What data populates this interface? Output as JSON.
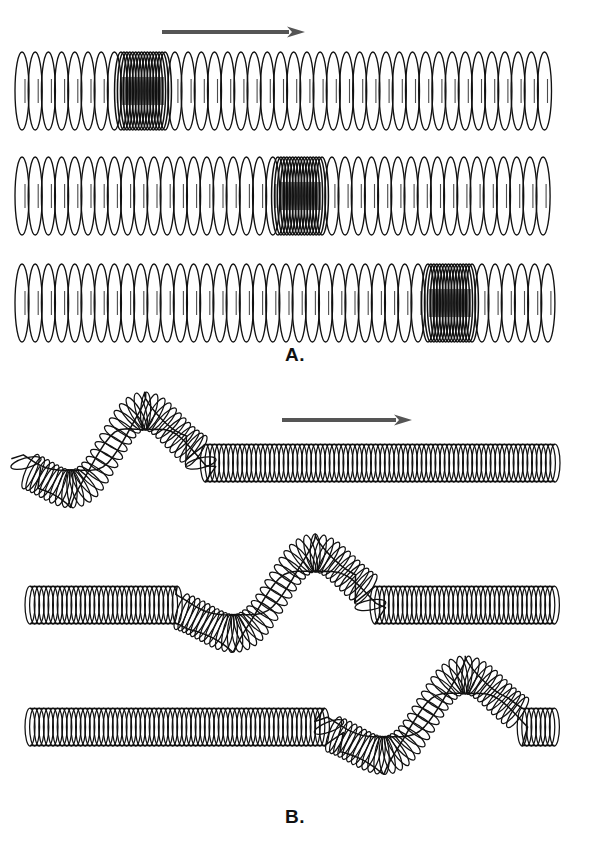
{
  "figure": {
    "background_color": "#ffffff",
    "ink_color": "#111111",
    "arrow_color": "#555555",
    "width": 592,
    "height": 853
  },
  "panels": [
    {
      "id": "panel-a",
      "label": "A.",
      "label_x": 295,
      "label_y": 356,
      "wave_type": "longitudinal",
      "description": "Compression pulse moving left to right along a stretched spring",
      "direction_arrow": {
        "name": "propagation-arrow-a",
        "x1": 162,
        "y1": 32,
        "x2": 305,
        "y2": 32,
        "color": "#555555",
        "thickness": 4,
        "head_length": 16,
        "head_width": 11
      },
      "springs": [
        {
          "name": "spring-row-1",
          "frame": 1,
          "y_center": 91,
          "x_start": 22,
          "x_end": 556,
          "coil_half_height": 39,
          "coil_half_width": 7.0,
          "normal_spacing": 13.2,
          "compression_center": 143,
          "compression_half_width": 22,
          "compression_spacing": 3.1,
          "compression_coils": 15
        },
        {
          "name": "spring-row-2",
          "frame": 2,
          "y_center": 196,
          "x_start": 22,
          "x_end": 556,
          "coil_half_height": 39,
          "coil_half_width": 7.0,
          "normal_spacing": 13.2,
          "compression_center": 300,
          "compression_half_width": 22,
          "compression_spacing": 3.1,
          "compression_coils": 15
        },
        {
          "name": "spring-row-3",
          "frame": 3,
          "y_center": 303,
          "x_start": 22,
          "x_end": 556,
          "coil_half_height": 39,
          "coil_half_width": 7.0,
          "normal_spacing": 13.2,
          "compression_center": 450,
          "compression_half_width": 22,
          "compression_spacing": 3.1,
          "compression_coils": 15
        }
      ]
    },
    {
      "id": "panel-b",
      "label": "B.",
      "label_x": 295,
      "label_y": 820,
      "wave_type": "transverse",
      "description": "Transverse pulse moving left to right along a slinky spring",
      "direction_arrow": {
        "name": "propagation-arrow-b",
        "x1": 282,
        "y1": 420,
        "x2": 412,
        "y2": 420,
        "color": "#555555",
        "thickness": 4,
        "head_length": 16,
        "head_width": 11
      },
      "waves": [
        {
          "name": "transverse-wave-1",
          "frame": 1,
          "x_start": 26,
          "x_end": 556,
          "baseline": 463,
          "tube_half_height": 19,
          "coil_spacing": 4.6,
          "coil_half_width": 5.0,
          "pulse_start": 26,
          "pulse_end": 200,
          "trough_x": 84,
          "trough_offset": 44,
          "crest_x": 140,
          "crest_offset": -68,
          "lead_in_offset": -26
        },
        {
          "name": "transverse-wave-2",
          "frame": 2,
          "x_start": 30,
          "x_end": 556,
          "baseline": 605,
          "tube_half_height": 19,
          "coil_spacing": 4.6,
          "coil_half_width": 5.0,
          "pulse_start": 180,
          "pulse_end": 370,
          "trough_x": 246,
          "trough_offset": 44,
          "crest_x": 312,
          "crest_offset": -68,
          "lead_in_offset": 0
        },
        {
          "name": "transverse-wave-3",
          "frame": 3,
          "x_start": 30,
          "x_end": 556,
          "baseline": 727,
          "tube_half_height": 19,
          "coil_spacing": 4.6,
          "coil_half_width": 5.0,
          "pulse_start": 330,
          "pulse_end": 520,
          "trough_x": 396,
          "trough_offset": 44,
          "crest_x": 462,
          "crest_offset": -68,
          "lead_in_offset": 0
        }
      ]
    }
  ]
}
